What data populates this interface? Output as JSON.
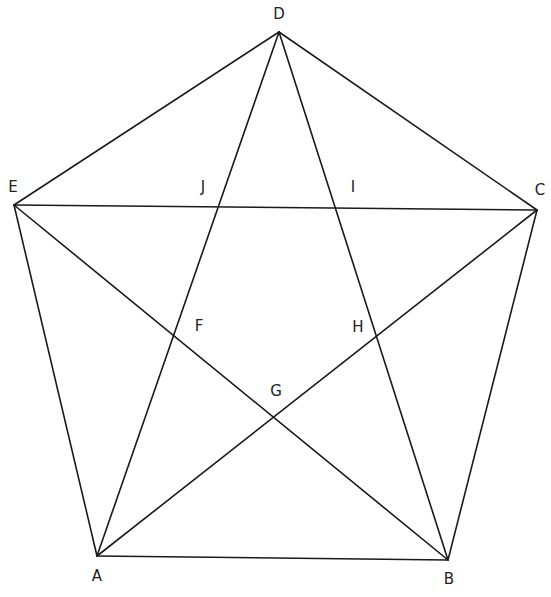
{
  "diagram": {
    "type": "pentagram-in-pentagon",
    "stroke_color": "#1a1a1a",
    "points": {
      "A": {
        "x": 97,
        "y": 556,
        "label": "A",
        "lx": 97,
        "ly": 576
      },
      "B": {
        "x": 448,
        "y": 560,
        "label": "B",
        "lx": 449,
        "ly": 579
      },
      "C": {
        "x": 537,
        "y": 210,
        "label": "C",
        "lx": 540,
        "ly": 190
      },
      "D": {
        "x": 279,
        "y": 32,
        "label": "D",
        "lx": 279,
        "ly": 14
      },
      "E": {
        "x": 14,
        "y": 205,
        "label": "E",
        "lx": 13,
        "ly": 187
      },
      "F": {
        "label": "F",
        "lx": 199,
        "ly": 326
      },
      "G": {
        "label": "G",
        "lx": 276,
        "ly": 391
      },
      "H": {
        "label": "H",
        "lx": 358,
        "ly": 327
      },
      "I": {
        "label": "I",
        "lx": 353,
        "ly": 187
      },
      "J": {
        "label": "J",
        "lx": 203,
        "ly": 187
      }
    },
    "segments": [
      [
        "A",
        "B"
      ],
      [
        "B",
        "C"
      ],
      [
        "C",
        "D"
      ],
      [
        "D",
        "E"
      ],
      [
        "E",
        "A"
      ],
      [
        "A",
        "D"
      ],
      [
        "A",
        "C"
      ],
      [
        "B",
        "D"
      ],
      [
        "B",
        "E"
      ],
      [
        "C",
        "E"
      ]
    ]
  }
}
